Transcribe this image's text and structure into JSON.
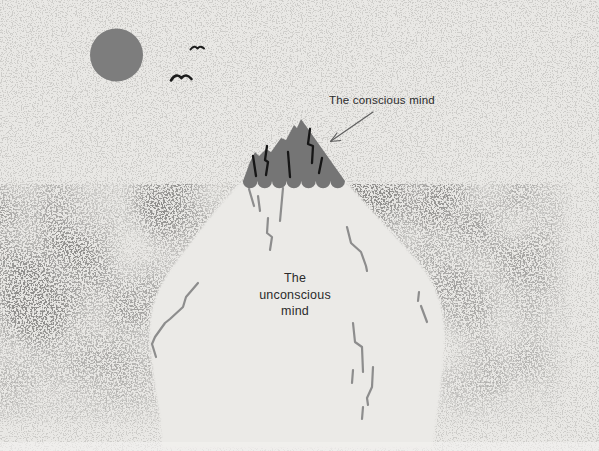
{
  "scene": {
    "background_color": "#e9e8e5",
    "sun_color": "#7d7d7d",
    "bird_color": "#1c1c1c",
    "water_dot_color": "#8f8e8c",
    "grain_color": "#a8a6a2",
    "iceberg_tip_color": "#757575",
    "iceberg_body_color": "#ebeae7",
    "tip_crack_color": "#161616",
    "body_crack_color": "#8d8d8d",
    "arrow_color": "#5f5f5f",
    "text_color": "#2b2b2b",
    "bottom_edge_color": "#f3f2f0"
  },
  "labels": {
    "conscious": "The conscious mind",
    "unconscious": [
      "The",
      "unconscious",
      "mind"
    ]
  }
}
